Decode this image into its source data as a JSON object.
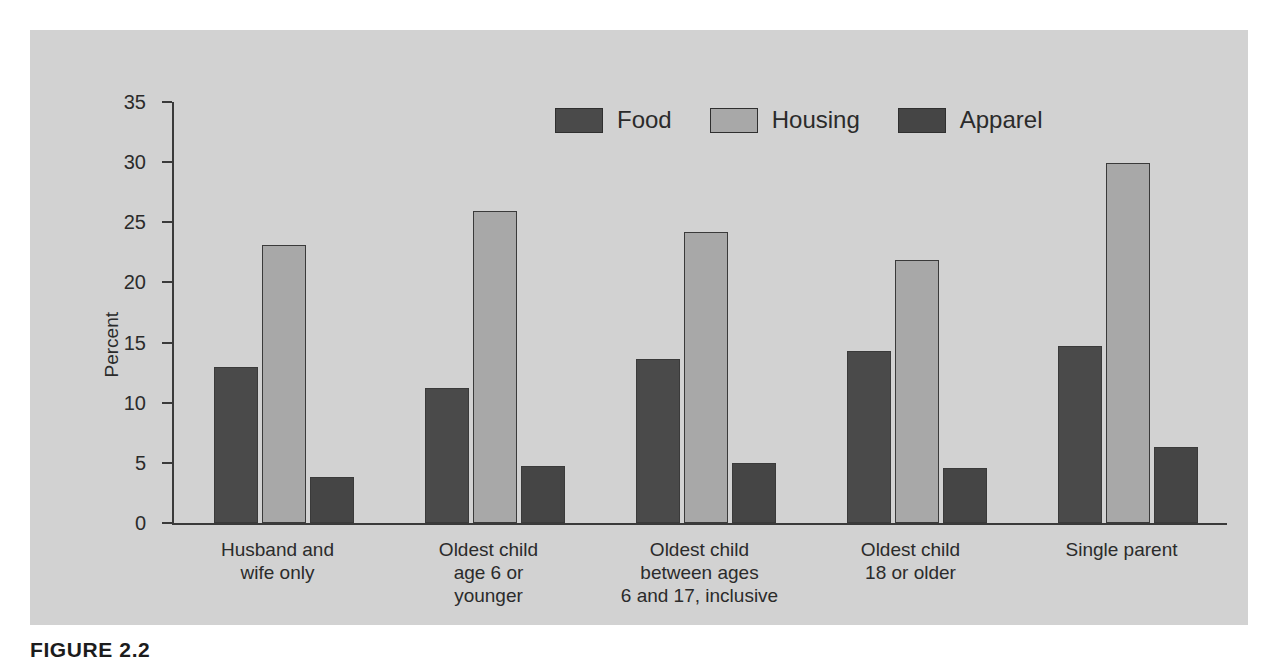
{
  "figure": {
    "caption": "FIGURE 2.2",
    "panel_background": "#d2d2d2",
    "page_background": "#ffffff"
  },
  "chart_data": {
    "type": "bar",
    "title": "",
    "xlabel": "",
    "ylabel": "Percent",
    "ylim": [
      0,
      35
    ],
    "yticks": [
      0,
      5,
      10,
      15,
      20,
      25,
      30,
      35
    ],
    "grid": false,
    "legend_position": "top-center",
    "categories": [
      "Husband and wife only",
      "Oldest child age 6 or younger",
      "Oldest child between ages 6 and 17, inclusive",
      "Oldest child 18 or older",
      "Single parent"
    ],
    "category_lines": [
      [
        "Husband and",
        "wife only"
      ],
      [
        "Oldest child",
        "age 6 or",
        "younger"
      ],
      [
        "Oldest child",
        "between ages",
        "6 and 17, inclusive"
      ],
      [
        "Oldest child",
        "18 or older"
      ],
      [
        "Single parent"
      ]
    ],
    "series": [
      {
        "name": "Food",
        "color": "#4a4a4a",
        "values": [
          13.0,
          11.2,
          13.6,
          14.3,
          14.7
        ]
      },
      {
        "name": "Housing",
        "color": "#a8a8a8",
        "values": [
          23.1,
          25.9,
          24.2,
          21.9,
          29.9
        ]
      },
      {
        "name": "Apparel",
        "color": "#454545",
        "values": [
          3.8,
          4.7,
          5.0,
          4.6,
          6.3
        ]
      }
    ]
  }
}
